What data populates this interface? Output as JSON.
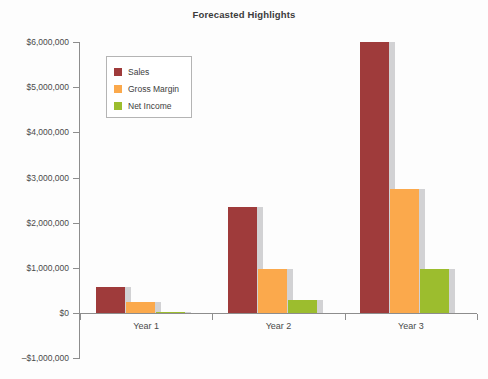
{
  "chart_data": {
    "type": "bar",
    "title": "Forecasted Highlights",
    "xlabel": "",
    "ylabel": "",
    "categories": [
      "Year 1",
      "Year 2",
      "Year 3"
    ],
    "series": [
      {
        "name": "Sales",
        "color": "#9f3b3b",
        "values": [
          580000,
          2350000,
          6000000
        ]
      },
      {
        "name": "Gross Margin",
        "color": "#fba94c",
        "values": [
          250000,
          970000,
          2750000
        ]
      },
      {
        "name": "Net Income",
        "color": "#9cbd2e",
        "values": [
          20000,
          280000,
          980000
        ]
      }
    ],
    "ylim": [
      -1000000,
      6000000
    ],
    "ytick_values": [
      6000000,
      5000000,
      4000000,
      3000000,
      2000000,
      1000000,
      0,
      -1000000
    ],
    "ytick_labels": [
      "$6,000,000",
      "$5,000,000",
      "$4,000,000",
      "$3,000,000",
      "$2,000,000",
      "$1,000,000",
      "$0",
      "–$1,000,000"
    ],
    "grid": false,
    "legend_position": "upper-left",
    "legend_entries": [
      "Sales",
      "Gross Margin",
      "Net Income"
    ]
  }
}
